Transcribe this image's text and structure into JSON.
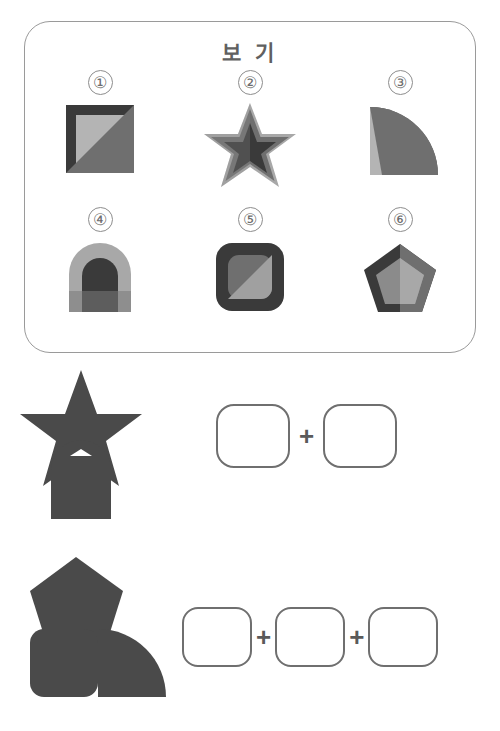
{
  "panel": {
    "title": "보 기",
    "border_color": "#9a9a9a",
    "options": [
      {
        "number": "①",
        "shape_name": "square-with-diagonal-split",
        "description": "Square with dark frame, light inner square and diagonal mid-gray overlay",
        "colors": {
          "frame": "#3a3a3a",
          "light": "#b4b4b4",
          "mid": "#6f6f6f"
        }
      },
      {
        "number": "②",
        "shape_name": "layered-star",
        "description": "Five-pointed star with light outer, mid-gray middle and dark inner star",
        "colors": {
          "outer": "#a8a8a8",
          "mid": "#6f6f6f",
          "inner": "#3a3a3a"
        }
      },
      {
        "number": "③",
        "shape_name": "quarter-circle",
        "description": "Quarter circle, mid-gray arc over light lower-left triangle",
        "colors": {
          "light": "#b4b4b4",
          "mid": "#6f6f6f"
        }
      },
      {
        "number": "④",
        "shape_name": "arch",
        "description": "Arch made of semicircle on rectangle, light outer and dark inner arch",
        "colors": {
          "light": "#a8a8a8",
          "dark": "#3a3a3a",
          "mid": "#5d5d5d"
        }
      },
      {
        "number": "⑤",
        "shape_name": "rounded-square",
        "description": "Dark rounded square with inner rounded square split diagonally",
        "colors": {
          "dark": "#3a3a3a",
          "mid": "#6f6f6f",
          "light": "#a0a0a0"
        }
      },
      {
        "number": "⑥",
        "shape_name": "layered-pentagon",
        "description": "Pentagon with inner pentagon, halves shaded differently",
        "colors": {
          "dark": "#3a3a3a",
          "mid": "#6f6f6f",
          "light": "#a8a8a8"
        }
      }
    ]
  },
  "questions": [
    {
      "id": "question-1",
      "figure_name": "star-over-arch-silhouette",
      "figure_description": "Solid dark silhouette of a star overlapping an arch",
      "figure_color": "#4a4a4a",
      "slots": 2,
      "separator": "+"
    },
    {
      "id": "question-2",
      "figure_name": "pentagon-square-quartercircle-silhouette",
      "figure_description": "Solid dark silhouette of a pentagon above a square and quarter circle",
      "figure_color": "#4a4a4a",
      "slots": 3,
      "separator": "+"
    }
  ]
}
